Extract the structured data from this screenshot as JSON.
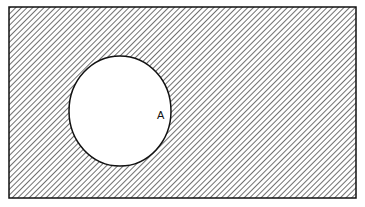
{
  "diagram": {
    "type": "venn",
    "universe": {
      "label": "",
      "shaded": true,
      "x": 9,
      "y": 7,
      "width": 347,
      "height": 191
    },
    "sets": [
      {
        "label": "A",
        "cx": 120,
        "cy": 111,
        "rx": 51,
        "ry": 55,
        "shaded": false,
        "label_x": 157,
        "label_y": 119
      }
    ],
    "shaded_region": "complement of A",
    "colors": {
      "stroke": "#111111",
      "hatch": "#333333",
      "background": "#ffffff"
    }
  }
}
